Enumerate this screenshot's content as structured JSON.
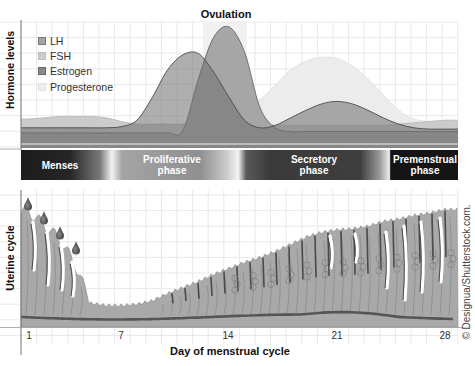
{
  "figure": {
    "ovulation_label": "Ovulation",
    "hormone_axis_label": "Hormone levels",
    "uterine_axis_label": "Uterine cycle",
    "x_axis_label": "Day of menstrual cycle",
    "credit": "© Designua/Shutterstock.com."
  },
  "legend": [
    {
      "label": "LH",
      "color": "#a3a3a3",
      "border": "#777777"
    },
    {
      "label": "FSH",
      "color": "#cdcdcd",
      "border": "#bdbdbd"
    },
    {
      "label": "Estrogen",
      "color": "#8a8a8a",
      "border": "#666666"
    },
    {
      "label": "Progesterone",
      "color": "#eeeeee",
      "border": "#e2e2e2"
    }
  ],
  "phases": [
    {
      "label": "Menses",
      "line2": ""
    },
    {
      "label": "Proliferative",
      "line2": "phase"
    },
    {
      "label": "Secretory",
      "line2": "phase"
    },
    {
      "label": "Premenstrual",
      "line2": "phase"
    }
  ],
  "x_ticks": [
    "1",
    "7",
    "14",
    "21",
    "28"
  ],
  "chart_data": {
    "type": "area",
    "title": "Ovulation",
    "xlabel": "Day of menstrual cycle",
    "ylabel": "Hormone levels",
    "x": [
      1,
      2,
      3,
      4,
      5,
      6,
      7,
      8,
      9,
      10,
      11,
      12,
      13,
      14,
      15,
      16,
      17,
      18,
      19,
      20,
      21,
      22,
      23,
      24,
      25,
      26,
      27,
      28
    ],
    "x_tick_labels": [
      1,
      7,
      14,
      21,
      28
    ],
    "ylim": [
      0,
      100
    ],
    "grid": true,
    "legend_position": "upper-left",
    "series": [
      {
        "name": "Progesterone",
        "color": "#ececec",
        "values": [
          10,
          10,
          10,
          10,
          10,
          10,
          10,
          10,
          10,
          10,
          10,
          11,
          14,
          20,
          28,
          38,
          50,
          62,
          69,
          72,
          71,
          65,
          55,
          42,
          30,
          23,
          21,
          21
        ]
      },
      {
        "name": "FSH",
        "color": "#cdcdcd",
        "values": [
          23,
          24,
          25,
          25,
          25,
          24,
          21,
          19,
          19,
          19,
          19,
          20,
          22,
          23,
          20,
          18,
          18,
          18,
          18,
          18,
          18,
          18,
          18,
          18,
          19,
          20,
          21,
          22
        ]
      },
      {
        "name": "LH",
        "color": "#a6a6a6",
        "values": [
          12,
          12,
          12,
          12,
          12,
          12,
          12,
          12,
          12,
          12,
          14,
          55,
          88,
          96,
          76,
          32,
          16,
          13,
          13,
          13,
          13,
          13,
          13,
          13,
          13,
          13,
          13,
          13
        ]
      },
      {
        "name": "Estrogen",
        "color": "#7c7c7c",
        "values": [
          16,
          16,
          16,
          16,
          16,
          16,
          17,
          22,
          40,
          62,
          74,
          75,
          60,
          40,
          22,
          16,
          18,
          24,
          30,
          35,
          37,
          35,
          30,
          24,
          19,
          16,
          15,
          15
        ]
      }
    ],
    "phases": [
      {
        "name": "Menses",
        "days": [
          1,
          5
        ]
      },
      {
        "name": "Proliferative phase",
        "days": [
          6,
          13
        ]
      },
      {
        "name": "Secretory phase",
        "days": [
          14,
          24
        ]
      },
      {
        "name": "Premenstrual phase",
        "days": [
          25,
          28
        ]
      }
    ],
    "endometrium_thickness": {
      "name": "Uterine cycle (relative endometrial thickness)",
      "values": [
        96,
        85,
        73,
        52,
        20,
        18,
        18,
        19,
        22,
        28,
        33,
        38,
        44,
        49,
        54,
        58,
        63,
        69,
        75,
        79,
        81,
        82,
        84,
        88,
        90,
        93,
        95,
        98
      ]
    },
    "annotations": [
      "Ovulation (day 14)",
      "Menstrual blood drops days 1-4"
    ]
  }
}
